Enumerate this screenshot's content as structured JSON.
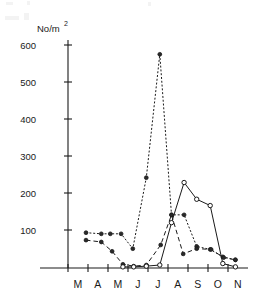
{
  "chart_data": {
    "type": "line",
    "title": "",
    "subtitle": "",
    "xlabel": "",
    "ylabel": "No/m2",
    "ylabel_display": "No/m",
    "ylabel_superscript": "2",
    "categories": [
      "M",
      "A",
      "M",
      "J",
      "J",
      "A",
      "S",
      "O",
      "N"
    ],
    "category_names": [
      "March",
      "April",
      "May",
      "June",
      "July",
      "August",
      "September",
      "October",
      "November"
    ],
    "x_tick_labels": [
      "M",
      "A",
      "M",
      "J",
      "J",
      "A",
      "S",
      "O",
      "N"
    ],
    "y_tick_labels": [
      "100",
      "200",
      "300",
      "400",
      "500",
      "600"
    ],
    "y_ticks": [
      100,
      200,
      300,
      400,
      500,
      600
    ],
    "ylim": [
      0,
      640
    ],
    "xlim": [
      0,
      10
    ],
    "grid": false,
    "legend": false,
    "legend_position": "none",
    "axis_color": "#1a1a1a",
    "background": "#ffffff",
    "series": [
      {
        "name": "dotted-series",
        "style": "dotted",
        "marker": "filled-circle",
        "x": [
          1.0,
          1.85,
          2.35,
          2.95,
          3.6,
          4.35,
          5.1,
          5.75,
          6.45,
          7.15,
          7.9,
          8.6,
          9.3
        ],
        "values": [
          95,
          92,
          92,
          92,
          52,
          243,
          575,
          143,
          143,
          58,
          50,
          30,
          22
        ]
      },
      {
        "name": "dashed-series",
        "style": "dashed",
        "marker": "filled-circle",
        "x": [
          1.0,
          1.85,
          2.45,
          3.05,
          3.65,
          4.35,
          5.15,
          5.75,
          6.4,
          7.15,
          7.95,
          8.65,
          9.3
        ],
        "values": [
          75,
          70,
          45,
          10,
          5,
          8,
          62,
          143,
          38,
          52,
          50,
          28,
          22
        ]
      },
      {
        "name": "solid-series",
        "style": "solid",
        "marker": "open-circle",
        "x": [
          3.05,
          3.65,
          4.35,
          5.1,
          5.75,
          6.45,
          7.15,
          7.9,
          8.6,
          9.3
        ],
        "values": [
          3,
          3,
          5,
          8,
          122,
          230,
          185,
          168,
          12,
          3
        ]
      }
    ],
    "annotations": [],
    "peak_value": 575,
    "peak_category": "J"
  },
  "axis_title": {
    "main": "No/m",
    "superscript": "2"
  }
}
